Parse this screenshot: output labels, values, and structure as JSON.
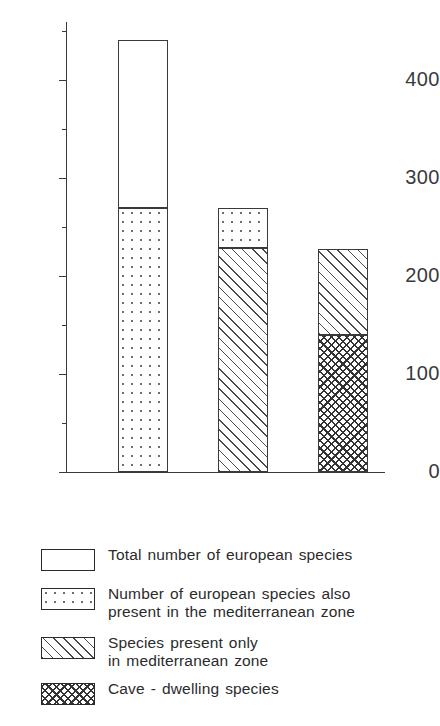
{
  "chart_data": {
    "type": "bar",
    "title": "",
    "subtitle": "",
    "xlabel": "",
    "ylabel": "",
    "stacked": true,
    "grid": false,
    "legend_position": "below",
    "ylim": [
      0,
      460
    ],
    "yticks": [
      0,
      100,
      200,
      300,
      400
    ],
    "ytick_labels": [
      "0",
      "100",
      "200",
      "300",
      "400"
    ],
    "yminor_ticks": [
      50,
      150,
      250,
      350,
      450
    ],
    "categories": [
      "Bar 1",
      "Bar 2",
      "Bar 3"
    ],
    "series": [
      {
        "name": "Total number of european species",
        "pattern": "blank",
        "values": [
          441,
          0,
          0
        ]
      },
      {
        "name": "Number of european species also present in the mediterranean zone",
        "pattern": "dots",
        "values": [
          269,
          269,
          0
        ]
      },
      {
        "name": "Species present only in mediterranean zone",
        "pattern": "diagonal-hatch",
        "values": [
          0,
          229,
          228
        ]
      },
      {
        "name": "Cave - dwelling species",
        "pattern": "cross-hatch",
        "values": [
          0,
          0,
          140
        ]
      }
    ],
    "bars": [
      {
        "label": "Bar 1",
        "total": 441,
        "segments": [
          {
            "pattern": "dots",
            "from": 0,
            "to": 269
          },
          {
            "pattern": "blank",
            "from": 269,
            "to": 441
          }
        ]
      },
      {
        "label": "Bar 2",
        "total": 269,
        "segments": [
          {
            "pattern": "diagonal-hatch",
            "from": 0,
            "to": 229
          },
          {
            "pattern": "dots",
            "from": 229,
            "to": 269
          }
        ]
      },
      {
        "label": "Bar 3",
        "total": 228,
        "segments": [
          {
            "pattern": "cross-hatch",
            "from": 0,
            "to": 140
          },
          {
            "pattern": "diagonal-hatch",
            "from": 140,
            "to": 228
          }
        ]
      }
    ],
    "annotations": []
  },
  "axis": {
    "y_tick_labels": [
      "400",
      "300",
      "200",
      "100",
      "0"
    ]
  },
  "legend": {
    "items": [
      {
        "pattern": "blank",
        "label": "Total  number  of  european  species"
      },
      {
        "pattern": "dots",
        "label": "Number of european  species also\npresent  in  the  mediterranean  zone"
      },
      {
        "pattern": "diagonal-hatch",
        "label": "Species  present only\nin mediterranean  zone"
      },
      {
        "pattern": "cross-hatch",
        "label": "Cave - dwelling  species"
      }
    ]
  },
  "colors": {
    "ink": "#2b2b2b",
    "axis": "#3a3a3a",
    "background": "#ffffff",
    "dot_fill": "#6e6e6e",
    "hatch_fill": "#4a4a4a",
    "cross_fill": "#333333"
  }
}
